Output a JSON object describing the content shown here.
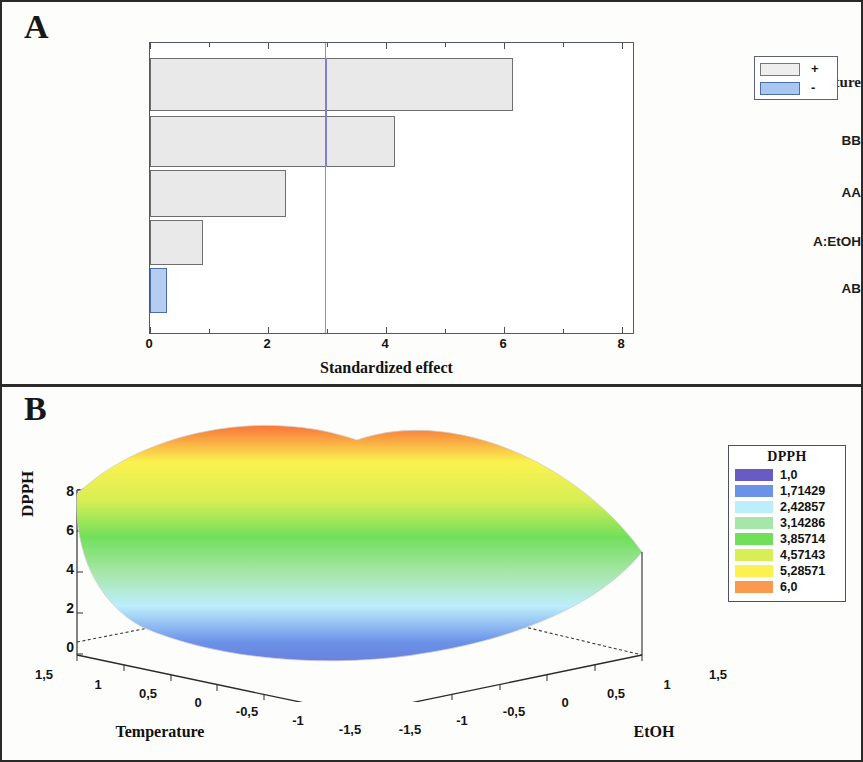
{
  "figure": {
    "panel_a_label": "A",
    "panel_b_label": "B"
  },
  "panel_a": {
    "x_axis_title": "Standardized effect",
    "x_ticks": [
      "0",
      "2",
      "4",
      "6",
      "8"
    ],
    "legend": {
      "positive_sign": "+",
      "negative_sign": "-",
      "positive_color": "#eeeeef",
      "negative_color": "#a9c6ee"
    },
    "categories": [
      "B: Temperature",
      "BB",
      "AA",
      "A:EtOH",
      "AB"
    ]
  },
  "panel_b": {
    "z_axis_title": "DPPH",
    "z_ticks": [
      "0",
      "2",
      "4",
      "6",
      "8"
    ],
    "x_axis_title": "Temperature",
    "y_axis_title": "EtOH",
    "temperature_ticks": [
      "1,5",
      "1",
      "0,5",
      "0",
      "-0,5",
      "-1",
      "-1,5"
    ],
    "etoh_ticks": [
      "-1,5",
      "-1",
      "-0,5",
      "0",
      "0,5",
      "1",
      "1,5"
    ],
    "legend_title": "DPPH",
    "legend_levels": [
      {
        "value": "1,0",
        "color": "#6a5bc4"
      },
      {
        "value": "1,71429",
        "color": "#6b92e8"
      },
      {
        "value": "2,42857",
        "color": "#bdeefb"
      },
      {
        "value": "3,14286",
        "color": "#a7e6a9"
      },
      {
        "value": "3,85714",
        "color": "#71df5c"
      },
      {
        "value": "4,57143",
        "color": "#d7ee54"
      },
      {
        "value": "5,28571",
        "color": "#fbf24f"
      },
      {
        "value": "6,0",
        "color": "#fa9a4e"
      }
    ]
  },
  "chart_data": [
    {
      "type": "bar",
      "title": "A",
      "orientation": "horizontal",
      "categories": [
        "B: Temperature",
        "BB",
        "AA",
        "A:EtOH",
        "AB"
      ],
      "values": [
        6.15,
        4.15,
        2.3,
        0.9,
        0.28
      ],
      "signs": [
        "+",
        "+",
        "+",
        "+",
        "-"
      ],
      "significance_threshold": 2.45,
      "xlabel": "Standardized effect",
      "ylabel": "",
      "xlim": [
        0,
        8.3
      ],
      "xticks": [
        0,
        2,
        4,
        6,
        8
      ],
      "grid": false,
      "legend": {
        "position": "right",
        "entries": [
          "+",
          "-"
        ]
      }
    },
    {
      "type": "surface",
      "title": "B",
      "zlabel": "DPPH",
      "xlabel": "Temperature",
      "ylabel": "EtOH",
      "xlim": [
        1.5,
        -1.5
      ],
      "ylim": [
        -1.5,
        1.5
      ],
      "zlim": [
        0,
        8
      ],
      "zticks": [
        0,
        2,
        4,
        6,
        8
      ],
      "xticks": [
        1.5,
        1,
        0.5,
        0,
        -0.5,
        -1,
        -1.5
      ],
      "yticks": [
        -1.5,
        -1,
        -0.5,
        0,
        0.5,
        1,
        1.5
      ],
      "colorbar_title": "DPPH",
      "colorbar_levels": [
        1.0,
        1.71429,
        2.42857,
        3.14286,
        3.85714,
        4.57143,
        5.28571,
        6.0
      ],
      "surface_description": "Convex bowl / saddle: minimum near centre-front (~0), rising to maxima (~7-8) at the rear and left-rear corners",
      "grid": false
    }
  ]
}
